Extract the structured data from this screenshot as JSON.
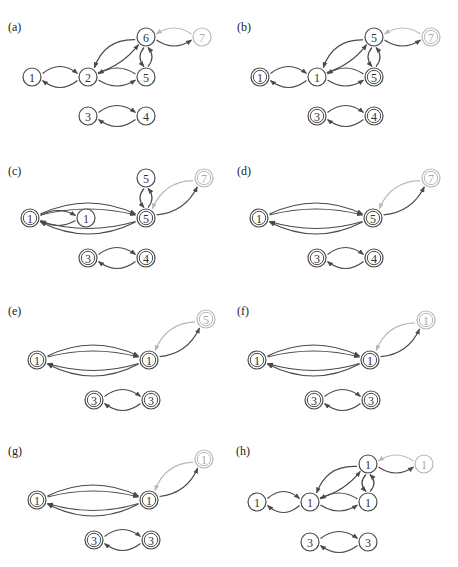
{
  "figure": {
    "colors": {
      "dark": "#4a4a4a",
      "light": "#b8b8b8",
      "text_dark": "#333333",
      "text_light": "#aaaaaa",
      "background": "#ffffff"
    },
    "node_radius": 9,
    "panels": [
      {
        "id": "a",
        "label": "(a)",
        "label_pos": [
          8,
          31
        ],
        "nodes": [
          {
            "id": "n1",
            "text": "1",
            "x": 32,
            "y": 77,
            "double": false,
            "light": false
          },
          {
            "id": "n2",
            "text": "2",
            "x": 88,
            "y": 77,
            "double": false,
            "light": false
          },
          {
            "id": "n5",
            "text": "5",
            "x": 146,
            "y": 77,
            "double": false,
            "light": false
          },
          {
            "id": "n6",
            "text": "6",
            "x": 146,
            "y": 37,
            "double": false,
            "light": false
          },
          {
            "id": "n7",
            "text": "7",
            "x": 202,
            "y": 37,
            "double": false,
            "light": true
          },
          {
            "id": "n3",
            "text": "3",
            "x": 88,
            "y": 116,
            "double": false,
            "light": false
          },
          {
            "id": "n4",
            "text": "4",
            "x": 146,
            "y": 116,
            "double": false,
            "light": false
          }
        ],
        "edges": [
          {
            "from": "n2",
            "to": "n1",
            "bend": -14
          },
          {
            "from": "n1",
            "to": "n2",
            "bend": -14
          },
          {
            "from": "n2",
            "to": "n5",
            "bend": 12
          },
          {
            "from": "n5",
            "to": "n2",
            "bend": 12
          },
          {
            "from": "n2",
            "to": "n6",
            "bend": 8
          },
          {
            "from": "n6",
            "to": "n2",
            "bend": 18
          },
          {
            "from": "n5",
            "to": "n6",
            "bend": 8
          },
          {
            "from": "n6",
            "to": "n5",
            "bend": 8
          },
          {
            "from": "n6",
            "to": "n7",
            "bend": 12
          },
          {
            "from": "n7",
            "to": "n6",
            "bend": 12,
            "light": true
          },
          {
            "from": "n4",
            "to": "n3",
            "bend": -14
          },
          {
            "from": "n3",
            "to": "n4",
            "bend": -14
          }
        ]
      },
      {
        "id": "b",
        "label": "(b)",
        "label_pos": [
          237,
          31
        ],
        "nodes": [
          {
            "id": "n1",
            "text": "1",
            "x": 260,
            "y": 77,
            "double": true,
            "light": false
          },
          {
            "id": "n2",
            "text": "1",
            "x": 317,
            "y": 77,
            "double": false,
            "light": false
          },
          {
            "id": "n5",
            "text": "5",
            "x": 374,
            "y": 77,
            "double": true,
            "light": false
          },
          {
            "id": "n6",
            "text": "5",
            "x": 374,
            "y": 37,
            "double": false,
            "light": false
          },
          {
            "id": "n7",
            "text": "7",
            "x": 431,
            "y": 37,
            "double": true,
            "light": true
          },
          {
            "id": "n3",
            "text": "3",
            "x": 317,
            "y": 116,
            "double": true,
            "light": false
          },
          {
            "id": "n4",
            "text": "4",
            "x": 374,
            "y": 116,
            "double": true,
            "light": false
          }
        ],
        "edges": [
          {
            "from": "n2",
            "to": "n1",
            "bend": -14
          },
          {
            "from": "n1",
            "to": "n2",
            "bend": -14
          },
          {
            "from": "n2",
            "to": "n5",
            "bend": 12
          },
          {
            "from": "n5",
            "to": "n2",
            "bend": 12
          },
          {
            "from": "n2",
            "to": "n6",
            "bend": 8
          },
          {
            "from": "n6",
            "to": "n2",
            "bend": 18
          },
          {
            "from": "n5",
            "to": "n6",
            "bend": 8
          },
          {
            "from": "n6",
            "to": "n5",
            "bend": 8
          },
          {
            "from": "n6",
            "to": "n7",
            "bend": 12
          },
          {
            "from": "n7",
            "to": "n6",
            "bend": 12,
            "light": true
          },
          {
            "from": "n4",
            "to": "n3",
            "bend": -14
          },
          {
            "from": "n3",
            "to": "n4",
            "bend": -14
          }
        ]
      },
      {
        "id": "c",
        "label": "(c)",
        "label_pos": [
          8,
          175
        ],
        "nodes": [
          {
            "id": "n1",
            "text": "1",
            "x": 30,
            "y": 218,
            "double": true,
            "light": false
          },
          {
            "id": "n2",
            "text": "1",
            "x": 86,
            "y": 218,
            "double": false,
            "light": false
          },
          {
            "id": "n5",
            "text": "5",
            "x": 146,
            "y": 218,
            "double": true,
            "light": false
          },
          {
            "id": "n6",
            "text": "5",
            "x": 146,
            "y": 178,
            "double": false,
            "light": false
          },
          {
            "id": "n7",
            "text": "7",
            "x": 204,
            "y": 178,
            "double": true,
            "light": true
          },
          {
            "id": "n3",
            "text": "3",
            "x": 88,
            "y": 258,
            "double": true,
            "light": false
          },
          {
            "id": "n4",
            "text": "4",
            "x": 146,
            "y": 258,
            "double": true,
            "light": false
          }
        ],
        "edges": [
          {
            "from": "n2",
            "to": "n1",
            "bend": -10
          },
          {
            "from": "n1",
            "to": "n2",
            "bend": -10
          },
          {
            "from": "n1",
            "to": "n5",
            "bend": -22
          },
          {
            "from": "n1",
            "to": "n5",
            "bend": -12
          },
          {
            "from": "n5",
            "to": "n1",
            "bend": -14
          },
          {
            "from": "n5",
            "to": "n1",
            "bend": -24
          },
          {
            "from": "n5",
            "to": "n6",
            "bend": 8
          },
          {
            "from": "n6",
            "to": "n5",
            "bend": 8
          },
          {
            "from": "n5",
            "to": "n7",
            "bend": 14
          },
          {
            "from": "n7",
            "to": "n5",
            "bend": 16,
            "light": true
          },
          {
            "from": "n4",
            "to": "n3",
            "bend": -14
          },
          {
            "from": "n3",
            "to": "n4",
            "bend": -14
          }
        ]
      },
      {
        "id": "d",
        "label": "(d)",
        "label_pos": [
          237,
          175
        ],
        "nodes": [
          {
            "id": "n1",
            "text": "1",
            "x": 259,
            "y": 218,
            "double": true,
            "light": false
          },
          {
            "id": "n5",
            "text": "5",
            "x": 373,
            "y": 218,
            "double": true,
            "light": false
          },
          {
            "id": "n7",
            "text": "7",
            "x": 431,
            "y": 178,
            "double": true,
            "light": true
          },
          {
            "id": "n3",
            "text": "3",
            "x": 317,
            "y": 258,
            "double": true,
            "light": false
          },
          {
            "id": "n4",
            "text": "4",
            "x": 374,
            "y": 258,
            "double": true,
            "light": false
          }
        ],
        "edges": [
          {
            "from": "n1",
            "to": "n5",
            "bend": -22
          },
          {
            "from": "n1",
            "to": "n5",
            "bend": -12
          },
          {
            "from": "n5",
            "to": "n1",
            "bend": -14
          },
          {
            "from": "n5",
            "to": "n1",
            "bend": -24
          },
          {
            "from": "n5",
            "to": "n7",
            "bend": 14
          },
          {
            "from": "n7",
            "to": "n5",
            "bend": 16,
            "light": true
          },
          {
            "from": "n4",
            "to": "n3",
            "bend": -14
          },
          {
            "from": "n3",
            "to": "n4",
            "bend": -14
          }
        ]
      },
      {
        "id": "e",
        "label": "(e)",
        "label_pos": [
          8,
          315
        ],
        "nodes": [
          {
            "id": "n1",
            "text": "1",
            "x": 37,
            "y": 360,
            "double": true,
            "light": false
          },
          {
            "id": "n5",
            "text": "1",
            "x": 149,
            "y": 360,
            "double": true,
            "light": false
          },
          {
            "id": "n7",
            "text": "5",
            "x": 206,
            "y": 319,
            "double": true,
            "light": true
          },
          {
            "id": "n3",
            "text": "3",
            "x": 94,
            "y": 400,
            "double": true,
            "light": false
          },
          {
            "id": "n4",
            "text": "3",
            "x": 151,
            "y": 400,
            "double": true,
            "light": false
          }
        ],
        "edges": [
          {
            "from": "n1",
            "to": "n5",
            "bend": -22
          },
          {
            "from": "n1",
            "to": "n5",
            "bend": -12
          },
          {
            "from": "n5",
            "to": "n1",
            "bend": -14
          },
          {
            "from": "n5",
            "to": "n1",
            "bend": -24
          },
          {
            "from": "n5",
            "to": "n7",
            "bend": 14
          },
          {
            "from": "n7",
            "to": "n5",
            "bend": 16,
            "light": true
          },
          {
            "from": "n4",
            "to": "n3",
            "bend": -14
          },
          {
            "from": "n3",
            "to": "n4",
            "bend": -14
          }
        ]
      },
      {
        "id": "f",
        "label": "(f)",
        "label_pos": [
          237,
          315
        ],
        "nodes": [
          {
            "id": "n1",
            "text": "1",
            "x": 257,
            "y": 360,
            "double": true,
            "light": false
          },
          {
            "id": "n5",
            "text": "1",
            "x": 370,
            "y": 360,
            "double": true,
            "light": false
          },
          {
            "id": "n7",
            "text": "1",
            "x": 426,
            "y": 320,
            "double": true,
            "light": true
          },
          {
            "id": "n3",
            "text": "3",
            "x": 314,
            "y": 400,
            "double": true,
            "light": false
          },
          {
            "id": "n4",
            "text": "3",
            "x": 371,
            "y": 400,
            "double": true,
            "light": false
          }
        ],
        "edges": [
          {
            "from": "n1",
            "to": "n5",
            "bend": -22
          },
          {
            "from": "n1",
            "to": "n5",
            "bend": -12
          },
          {
            "from": "n5",
            "to": "n1",
            "bend": -14
          },
          {
            "from": "n5",
            "to": "n1",
            "bend": -24
          },
          {
            "from": "n5",
            "to": "n7",
            "bend": 14
          },
          {
            "from": "n7",
            "to": "n5",
            "bend": 16,
            "light": true
          },
          {
            "from": "n4",
            "to": "n3",
            "bend": -14
          },
          {
            "from": "n3",
            "to": "n4",
            "bend": -14
          }
        ]
      },
      {
        "id": "g",
        "label": "(g)",
        "label_pos": [
          8,
          455
        ],
        "nodes": [
          {
            "id": "n1",
            "text": "1",
            "x": 37,
            "y": 500,
            "double": true,
            "light": false
          },
          {
            "id": "n5",
            "text": "1",
            "x": 149,
            "y": 500,
            "double": true,
            "light": false
          },
          {
            "id": "n7",
            "text": "1",
            "x": 204,
            "y": 459,
            "double": true,
            "light": true
          },
          {
            "id": "n3",
            "text": "3",
            "x": 94,
            "y": 540,
            "double": true,
            "light": false
          },
          {
            "id": "n4",
            "text": "3",
            "x": 151,
            "y": 540,
            "double": true,
            "light": false
          }
        ],
        "edges": [
          {
            "from": "n1",
            "to": "n5",
            "bend": -22
          },
          {
            "from": "n1",
            "to": "n5",
            "bend": -12
          },
          {
            "from": "n5",
            "to": "n1",
            "bend": -14
          },
          {
            "from": "n5",
            "to": "n1",
            "bend": -24
          },
          {
            "from": "n5",
            "to": "n7",
            "bend": 14
          },
          {
            "from": "n7",
            "to": "n5",
            "bend": 16,
            "light": true
          },
          {
            "from": "n4",
            "to": "n3",
            "bend": -14
          },
          {
            "from": "n3",
            "to": "n4",
            "bend": -14
          }
        ]
      },
      {
        "id": "h",
        "label": "(h)",
        "label_pos": [
          236,
          455
        ],
        "nodes": [
          {
            "id": "n1",
            "text": "1",
            "x": 257,
            "y": 502,
            "double": false,
            "light": false
          },
          {
            "id": "n2",
            "text": "1",
            "x": 310,
            "y": 502,
            "double": false,
            "light": false
          },
          {
            "id": "n5",
            "text": "1",
            "x": 368,
            "y": 502,
            "double": false,
            "light": false
          },
          {
            "id": "n6",
            "text": "1",
            "x": 368,
            "y": 464,
            "double": false,
            "light": false
          },
          {
            "id": "n7",
            "text": "1",
            "x": 424,
            "y": 464,
            "double": false,
            "light": true
          },
          {
            "id": "n3",
            "text": "3",
            "x": 310,
            "y": 542,
            "double": false,
            "light": false
          },
          {
            "id": "n4",
            "text": "3",
            "x": 368,
            "y": 542,
            "double": false,
            "light": false
          }
        ],
        "edges": [
          {
            "from": "n2",
            "to": "n1",
            "bend": -14
          },
          {
            "from": "n1",
            "to": "n2",
            "bend": -14
          },
          {
            "from": "n2",
            "to": "n5",
            "bend": 12
          },
          {
            "from": "n5",
            "to": "n2",
            "bend": 12
          },
          {
            "from": "n2",
            "to": "n6",
            "bend": 8
          },
          {
            "from": "n6",
            "to": "n2",
            "bend": 18
          },
          {
            "from": "n5",
            "to": "n6",
            "bend": 8
          },
          {
            "from": "n6",
            "to": "n5",
            "bend": 8
          },
          {
            "from": "n6",
            "to": "n7",
            "bend": 12
          },
          {
            "from": "n7",
            "to": "n6",
            "bend": 12,
            "light": true
          },
          {
            "from": "n4",
            "to": "n3",
            "bend": -14
          },
          {
            "from": "n3",
            "to": "n4",
            "bend": -14
          }
        ]
      }
    ]
  }
}
